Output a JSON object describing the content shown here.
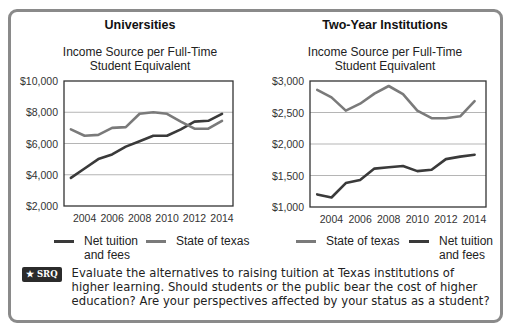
{
  "left": {
    "title": "Universities",
    "subtitle_line1": "Income Source per Full-Time",
    "subtitle_line2": "Student Equivalent",
    "legend": [
      {
        "label_line1": "Net tuition",
        "label_line2": "and fees",
        "color": "#3a3a3a"
      },
      {
        "label_line1": "State of texas",
        "label_line2": "",
        "color": "#7a7a7a"
      }
    ]
  },
  "right": {
    "title": "Two-Year Institutions",
    "subtitle_line1": "Income Source per Full-Time",
    "subtitle_line2": "Student Equivalent",
    "legend": [
      {
        "label_line1": "State of texas",
        "label_line2": "",
        "color": "#7a7a7a"
      },
      {
        "label_line1": "Net tuition",
        "label_line2": "and fees",
        "color": "#3a3a3a"
      }
    ]
  },
  "srq": {
    "badge": "★ SRQ",
    "text": "Evaluate the alternatives to raising tuition at Texas institutions of higher learning. Should students or the public bear the cost of higher education? Are your perspectives affected by your status as a student?"
  },
  "chart_data": [
    {
      "type": "line",
      "title": "Universities",
      "subtitle": "Income Source per Full-Time Student Equivalent",
      "xlabel": "",
      "ylabel": "",
      "x": [
        2003,
        2004,
        2005,
        2006,
        2007,
        2008,
        2009,
        2010,
        2011,
        2012,
        2013,
        2014
      ],
      "xticks": [
        "2004",
        "2006",
        "2008",
        "2010",
        "2012",
        "2014"
      ],
      "yticks": [
        "$2,000",
        "$4,000",
        "$6,000",
        "$8,000",
        "$10,000"
      ],
      "ylim": [
        2000,
        10000
      ],
      "grid": true,
      "legend_position": "bottom",
      "series": [
        {
          "name": "Net tuition and fees",
          "color": "#3a3a3a",
          "values": [
            3800,
            4400,
            5000,
            5300,
            5800,
            6150,
            6500,
            6500,
            6900,
            7400,
            7450,
            7900
          ]
        },
        {
          "name": "State of texas",
          "color": "#7a7a7a",
          "values": [
            6900,
            6500,
            6550,
            7000,
            7050,
            7900,
            8000,
            7900,
            7400,
            6950,
            6950,
            7450
          ]
        }
      ]
    },
    {
      "type": "line",
      "title": "Two-Year Institutions",
      "subtitle": "Income Source per Full-Time Student Equivalent",
      "xlabel": "",
      "ylabel": "",
      "x": [
        2003,
        2004,
        2005,
        2006,
        2007,
        2008,
        2009,
        2010,
        2011,
        2012,
        2013,
        2014
      ],
      "xticks": [
        "2004",
        "2006",
        "2008",
        "2010",
        "2012",
        "2014"
      ],
      "yticks": [
        "$1,000",
        "$1,500",
        "$2,000",
        "$2,500",
        "$3,000"
      ],
      "ylim": [
        1000,
        3000
      ],
      "grid": true,
      "legend_position": "bottom",
      "series": [
        {
          "name": "State of texas",
          "color": "#7a7a7a",
          "values": [
            2860,
            2740,
            2530,
            2640,
            2800,
            2920,
            2790,
            2530,
            2410,
            2410,
            2440,
            2680
          ]
        },
        {
          "name": "Net tuition and fees",
          "color": "#3a3a3a",
          "values": [
            1200,
            1150,
            1380,
            1430,
            1610,
            1630,
            1650,
            1570,
            1590,
            1760,
            1800,
            1830
          ]
        }
      ]
    }
  ]
}
